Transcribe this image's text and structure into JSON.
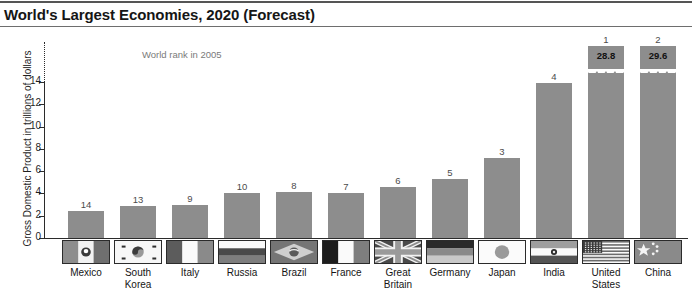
{
  "chart_data": {
    "type": "bar",
    "title": "World's Largest Economies, 2020 (Forecast)",
    "xlabel": "",
    "ylabel": "Gross Domestic Product in trillions of dollars",
    "ylim": [
      0,
      14
    ],
    "ytick_step": 2,
    "yticks": [
      "0",
      "2",
      "4",
      "6",
      "8",
      "10",
      "12",
      "14"
    ],
    "grid": false,
    "legend": "none",
    "axis_break": true,
    "annotation": "World rank in 2005",
    "categories": [
      "Mexico",
      "South Korea",
      "Italy",
      "Russia",
      "Brazil",
      "France",
      "Great Britain",
      "Germany",
      "Japan",
      "India",
      "United States",
      "China"
    ],
    "values": [
      2.4,
      2.9,
      3.0,
      4.0,
      4.1,
      4.0,
      4.6,
      5.3,
      7.2,
      13.9,
      28.8,
      29.6
    ],
    "rank_labels": [
      "14",
      "13",
      "9",
      "10",
      "8",
      "7",
      "6",
      "5",
      "3",
      "4",
      "1",
      "2"
    ],
    "value_labels": [
      "",
      "",
      "",
      "",
      "",
      "",
      "",
      "",
      "",
      "",
      "28.8",
      "29.6"
    ],
    "broken_bars": [
      false,
      false,
      false,
      false,
      false,
      false,
      false,
      false,
      false,
      false,
      true,
      true
    ],
    "bar_color": "#8d8d8d",
    "axis_color": "#2b2b2b",
    "annotation_color": "#7a7a7a"
  },
  "bars": [
    {
      "country": "Mexico",
      "country_line1": "Mexico",
      "country_line2": "",
      "rank": "14",
      "value_label": "",
      "flag": "mexico-flag-icon"
    },
    {
      "country": "South Korea",
      "country_line1": "South",
      "country_line2": "Korea",
      "rank": "13",
      "value_label": "",
      "flag": "south-korea-flag-icon"
    },
    {
      "country": "Italy",
      "country_line1": "Italy",
      "country_line2": "",
      "rank": "9",
      "value_label": "",
      "flag": "italy-flag-icon"
    },
    {
      "country": "Russia",
      "country_line1": "Russia",
      "country_line2": "",
      "rank": "10",
      "value_label": "",
      "flag": "russia-flag-icon"
    },
    {
      "country": "Brazil",
      "country_line1": "Brazil",
      "country_line2": "",
      "rank": "8",
      "value_label": "",
      "flag": "brazil-flag-icon"
    },
    {
      "country": "France",
      "country_line1": "France",
      "country_line2": "",
      "rank": "7",
      "value_label": "",
      "flag": "france-flag-icon"
    },
    {
      "country": "Great Britain",
      "country_line1": "Great",
      "country_line2": "Britain",
      "rank": "6",
      "value_label": "",
      "flag": "great-britain-flag-icon"
    },
    {
      "country": "Germany",
      "country_line1": "Germany",
      "country_line2": "",
      "rank": "5",
      "value_label": "",
      "flag": "germany-flag-icon"
    },
    {
      "country": "Japan",
      "country_line1": "Japan",
      "country_line2": "",
      "rank": "3",
      "value_label": "",
      "flag": "japan-flag-icon"
    },
    {
      "country": "India",
      "country_line1": "India",
      "country_line2": "",
      "rank": "4",
      "value_label": "",
      "flag": "india-flag-icon"
    },
    {
      "country": "United States",
      "country_line1": "United",
      "country_line2": "States",
      "rank": "1",
      "value_label": "28.8",
      "flag": "united-states-flag-icon"
    },
    {
      "country": "China",
      "country_line1": "China",
      "country_line2": "",
      "rank": "2",
      "value_label": "29.6",
      "flag": "china-flag-icon"
    }
  ]
}
